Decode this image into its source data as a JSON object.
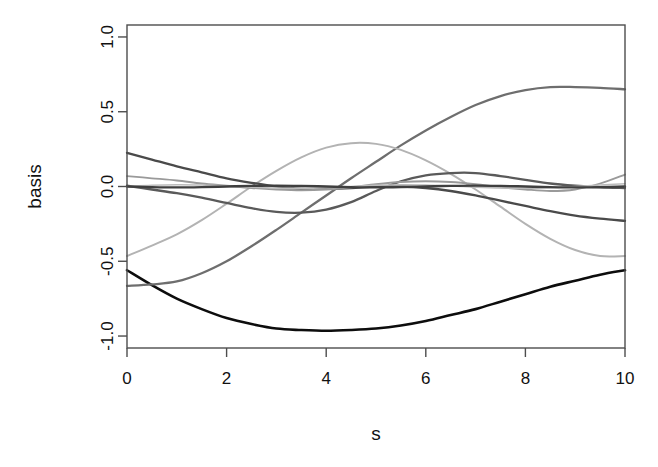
{
  "chart_data": {
    "type": "line",
    "title": "",
    "xlabel": "s",
    "ylabel": "basis",
    "xlim": [
      0,
      10
    ],
    "ylim": [
      -1.08,
      1.08
    ],
    "grid": false,
    "legend": "none",
    "box": true,
    "xticks": [
      0,
      2,
      4,
      6,
      8,
      10
    ],
    "xtick_labels": [
      "0",
      "2",
      "4",
      "6",
      "8",
      "10"
    ],
    "yticks": [
      -1.0,
      -0.5,
      0.0,
      0.5,
      1.0
    ],
    "ytick_labels": [
      "-1.0",
      "-0.5",
      "0.0",
      "0.5",
      "1.0"
    ],
    "x": [
      0,
      0.5,
      1,
      1.5,
      2,
      2.5,
      3,
      3.5,
      4,
      4.5,
      5,
      5.5,
      6,
      6.5,
      7,
      7.5,
      8,
      8.5,
      9,
      9.5,
      10
    ],
    "series": [
      {
        "name": "basis-1",
        "color": "#0d0d0d",
        "width": 2.6,
        "values": [
          -0.56,
          -0.66,
          -0.75,
          -0.82,
          -0.88,
          -0.92,
          -0.95,
          -0.96,
          -0.965,
          -0.96,
          -0.95,
          -0.93,
          -0.9,
          -0.86,
          -0.82,
          -0.77,
          -0.72,
          -0.67,
          -0.63,
          -0.59,
          -0.56
        ]
      },
      {
        "name": "basis-2",
        "color": "#6e6e6e",
        "width": 2.3,
        "values": [
          -0.665,
          -0.655,
          -0.635,
          -0.58,
          -0.5,
          -0.4,
          -0.29,
          -0.175,
          -0.06,
          0.055,
          0.165,
          0.275,
          0.375,
          0.465,
          0.545,
          0.605,
          0.645,
          0.665,
          0.665,
          0.66,
          0.65
        ]
      },
      {
        "name": "basis-3",
        "color": "#b3b3b3",
        "width": 2.0,
        "values": [
          -0.465,
          -0.395,
          -0.32,
          -0.225,
          -0.115,
          0.0,
          0.105,
          0.195,
          0.26,
          0.29,
          0.285,
          0.245,
          0.175,
          0.085,
          -0.02,
          -0.135,
          -0.25,
          -0.35,
          -0.425,
          -0.465,
          -0.465
        ]
      },
      {
        "name": "basis-4",
        "color": "#4a4a4a",
        "width": 2.3,
        "values": [
          0.225,
          0.18,
          0.135,
          0.095,
          0.055,
          0.025,
          0.0,
          -0.015,
          -0.015,
          -0.01,
          0.0,
          0.0,
          -0.01,
          -0.03,
          -0.06,
          -0.095,
          -0.13,
          -0.165,
          -0.195,
          -0.215,
          -0.23
        ]
      },
      {
        "name": "basis-5",
        "color": "#5a5a5a",
        "width": 2.3,
        "values": [
          0.005,
          -0.02,
          -0.045,
          -0.075,
          -0.11,
          -0.145,
          -0.17,
          -0.175,
          -0.155,
          -0.105,
          -0.03,
          0.035,
          0.075,
          0.09,
          0.09,
          0.07,
          0.045,
          0.02,
          0.005,
          -0.005,
          -0.01
        ]
      },
      {
        "name": "basis-6",
        "color": "#9a9a9a",
        "width": 1.8,
        "values": [
          0.07,
          0.055,
          0.04,
          0.02,
          0.005,
          -0.01,
          -0.02,
          -0.025,
          -0.02,
          -0.005,
          0.015,
          0.03,
          0.035,
          0.03,
          0.015,
          -0.005,
          -0.02,
          -0.03,
          -0.02,
          0.02,
          0.08
        ]
      },
      {
        "name": "basis-7",
        "color": "#bcbcbc",
        "width": 1.6,
        "values": [
          0.0,
          0.008,
          0.012,
          0.01,
          0.004,
          -0.004,
          -0.01,
          -0.012,
          -0.008,
          0.0,
          0.008,
          0.012,
          0.01,
          0.004,
          -0.004,
          -0.01,
          -0.012,
          -0.008,
          0.0,
          0.01,
          0.018
        ]
      },
      {
        "name": "basis-8",
        "color": "#3f3f3f",
        "width": 2.4,
        "values": [
          0.0,
          -0.004,
          -0.006,
          -0.004,
          0.0,
          0.004,
          0.006,
          0.004,
          0.0,
          -0.004,
          -0.006,
          -0.004,
          0.0,
          0.004,
          0.006,
          0.004,
          0.0,
          -0.004,
          -0.006,
          -0.004,
          0.0
        ]
      }
    ]
  },
  "plot": {
    "box_left_px": 127,
    "box_right_px": 625,
    "box_top_px": 25,
    "box_bottom_px": 348
  }
}
